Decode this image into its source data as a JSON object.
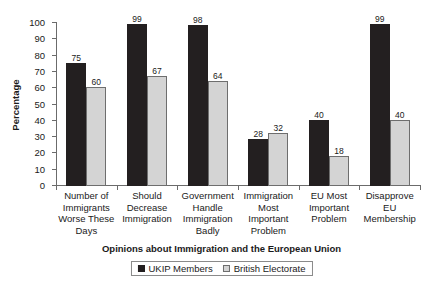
{
  "chart_data": {
    "type": "bar",
    "title": "",
    "xlabel": "Opinions about Immigration and the European Union",
    "ylabel": "Percentage",
    "ylim": [
      0,
      100
    ],
    "ytick_step": 10,
    "yticks": [
      0,
      10,
      20,
      30,
      40,
      50,
      60,
      70,
      80,
      90,
      100
    ],
    "grid": false,
    "legend_position": "bottom-center",
    "categories": [
      "Number of Immigrants Worse These Days",
      "Should Decrease Immigration",
      "Government Handle Immigration Badly",
      "Immigration Most Important Problem",
      "EU Most Important Problem",
      "Disapprove EU Membership"
    ],
    "category_lines": [
      [
        "Number of",
        "Immigrants",
        "Worse These",
        "Days"
      ],
      [
        "Should",
        "Decrease",
        "Immigration"
      ],
      [
        "Government",
        "Handle",
        "Immigration",
        "Badly"
      ],
      [
        "Immigration",
        "Most",
        "Important",
        "Problem"
      ],
      [
        "EU Most",
        "Important",
        "Problem"
      ],
      [
        "Disapprove",
        "EU",
        "Membership"
      ]
    ],
    "series": [
      {
        "name": "UKIP Members",
        "color": "#231f20",
        "values": [
          75,
          99,
          98,
          28,
          40,
          99
        ]
      },
      {
        "name": "British Electorate",
        "color": "#d4d4d4",
        "values": [
          60,
          67,
          64,
          32,
          18,
          40
        ]
      }
    ]
  },
  "legend": {
    "entries": [
      {
        "label": "UKIP Members"
      },
      {
        "label": "British Electorate"
      }
    ]
  },
  "colors": {
    "series_0": "#231f20",
    "series_1": "#d4d4d4",
    "axis": "#6b6b6b",
    "text": "#1a1a1a",
    "background": "#ffffff"
  }
}
